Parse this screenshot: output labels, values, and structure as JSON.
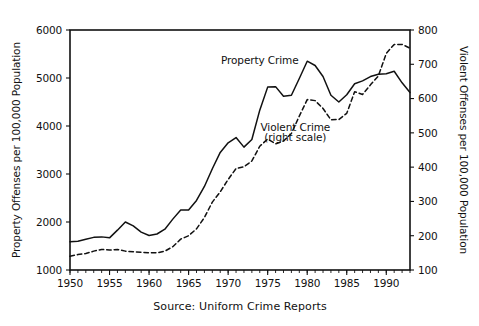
{
  "chart_data": {
    "type": "line",
    "title": "",
    "subtitle": "",
    "caption": "Source: Uniform Crime Reports",
    "xlabel": "",
    "ylabel": "Property Offenses per 100,000 Population",
    "y2label": "Violent Offenses per 100,000 Population",
    "xlim": [
      1950,
      1993
    ],
    "ylim": [
      1000,
      6000
    ],
    "y2lim": [
      100,
      800
    ],
    "grid": false,
    "legend_position": "inline-annotations",
    "x_ticks": [
      1950,
      1955,
      1960,
      1965,
      1970,
      1975,
      1980,
      1985,
      1990
    ],
    "x_tick_labels": [
      "1950",
      "1955",
      "1960",
      "1965",
      "1970",
      "1975",
      "1980",
      "1985",
      "1990"
    ],
    "x_minor_tick_step": 1,
    "y_ticks": [
      1000,
      2000,
      3000,
      4000,
      5000,
      6000
    ],
    "y_tick_labels": [
      "1000",
      "2000",
      "3000",
      "4000",
      "5000",
      "6000"
    ],
    "y2_ticks": [
      100,
      200,
      300,
      400,
      500,
      600,
      700,
      800
    ],
    "y2_tick_labels": [
      "100",
      "200",
      "300",
      "400",
      "500",
      "600",
      "700",
      "800"
    ],
    "x": [
      1950,
      1951,
      1952,
      1953,
      1954,
      1955,
      1956,
      1957,
      1958,
      1959,
      1960,
      1961,
      1962,
      1963,
      1964,
      1965,
      1966,
      1967,
      1968,
      1969,
      1970,
      1971,
      1972,
      1973,
      1974,
      1975,
      1976,
      1977,
      1978,
      1979,
      1980,
      1981,
      1982,
      1983,
      1984,
      1985,
      1986,
      1987,
      1988,
      1989,
      1990,
      1991,
      1992,
      1993
    ],
    "series": [
      {
        "name": "Property Crime",
        "axis": "left",
        "style": "solid",
        "color": "#111111",
        "annotation": "Property Crime",
        "values": [
          1590,
          1600,
          1640,
          1680,
          1690,
          1670,
          1830,
          2000,
          1920,
          1790,
          1720,
          1750,
          1850,
          2060,
          2250,
          2250,
          2450,
          2740,
          3110,
          3450,
          3650,
          3760,
          3560,
          3720,
          4330,
          4810,
          4820,
          4620,
          4640,
          4990,
          5350,
          5260,
          5030,
          4640,
          4500,
          4650,
          4880,
          4940,
          5030,
          5080,
          5090,
          5140,
          4900,
          4700
        ]
      },
      {
        "name": "Violent Crime",
        "axis": "right",
        "style": "dashed",
        "color": "#111111",
        "annotation": "Violent Crime",
        "annotation_sub": "(right scale)",
        "values": [
          140,
          145,
          148,
          155,
          160,
          158,
          160,
          155,
          153,
          152,
          150,
          150,
          155,
          168,
          190,
          200,
          220,
          253,
          298,
          328,
          364,
          396,
          401,
          418,
          461,
          482,
          468,
          476,
          498,
          549,
          597,
          594,
          571,
          538,
          539,
          557,
          620,
          612,
          640,
          666,
          732,
          758,
          758,
          747
        ]
      }
    ],
    "annotations": [
      {
        "text": "Property Crime",
        "x": 1974,
        "y": 5300
      },
      {
        "text": "Violent Crime",
        "x": 1978.5,
        "y": 3900
      },
      {
        "text": "(right scale)",
        "x": 1978.5,
        "y": 3680
      }
    ]
  }
}
